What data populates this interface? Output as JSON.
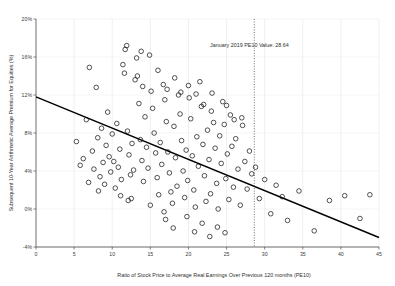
{
  "chart_data": {
    "type": "scatter",
    "title": "",
    "xlabel": "Ratio of Stock Price to Average Real Earnings Over Previous 120 months (PE10)",
    "ylabel": "Subsequent 10-Year Arithmetic Average Premium for Equities (%)",
    "xlim": [
      0,
      45
    ],
    "ylim": [
      -4,
      20
    ],
    "xticks": [
      0,
      5,
      10,
      15,
      20,
      25,
      30,
      35,
      40,
      45
    ],
    "xtick_labels": [
      "0",
      "5",
      "10",
      "15",
      "20",
      "25",
      "30",
      "35",
      "40",
      "45"
    ],
    "yticks": [
      -4,
      0,
      4,
      8,
      12,
      16,
      20
    ],
    "ytick_labels": [
      "-4%",
      "0%",
      "4%",
      "8%",
      "12%",
      "16%",
      "20%"
    ],
    "grid": true,
    "legend": "none",
    "marker": "open-circle",
    "marker_color": "#1a1a1a",
    "line_color": "#000000",
    "annotations": [
      {
        "name": "january-2019-pe10-marker",
        "text": "January 2019 PE10 Value: 28.64",
        "x": 28.64,
        "style": "vertical-dotted-line",
        "label_x": 28.0,
        "label_y": 17.1
      }
    ],
    "trendline": {
      "name": "linear-fit",
      "x_start": 0,
      "y_start": 11.8,
      "x_end": 45,
      "y_end": -3.0
    },
    "points": [
      [
        5.3,
        7.1
      ],
      [
        5.8,
        4.6
      ],
      [
        6.2,
        5.3
      ],
      [
        6.6,
        9.4
      ],
      [
        7.0,
        14.9
      ],
      [
        7.4,
        6.1
      ],
      [
        7.6,
        4.2
      ],
      [
        7.9,
        12.8
      ],
      [
        8.1,
        7.5
      ],
      [
        8.4,
        3.4
      ],
      [
        8.6,
        8.5
      ],
      [
        8.8,
        4.9
      ],
      [
        9.0,
        2.6
      ],
      [
        9.2,
        6.7
      ],
      [
        9.4,
        10.2
      ],
      [
        9.6,
        5.5
      ],
      [
        9.8,
        3.9
      ],
      [
        10.0,
        7.9
      ],
      [
        10.2,
        5.0
      ],
      [
        10.4,
        2.2
      ],
      [
        10.6,
        9.0
      ],
      [
        10.8,
        4.4
      ],
      [
        11.0,
        6.3
      ],
      [
        11.2,
        3.1
      ],
      [
        11.4,
        15.2
      ],
      [
        11.6,
        14.3
      ],
      [
        11.7,
        16.8
      ],
      [
        11.9,
        17.2
      ],
      [
        12.0,
        8.2
      ],
      [
        12.2,
        5.7
      ],
      [
        12.4,
        3.6
      ],
      [
        12.6,
        6.9
      ],
      [
        12.8,
        4.1
      ],
      [
        13.0,
        13.6
      ],
      [
        13.2,
        15.9
      ],
      [
        13.3,
        14.0
      ],
      [
        13.5,
        11.1
      ],
      [
        13.7,
        7.3
      ],
      [
        13.9,
        5.1
      ],
      [
        14.1,
        2.9
      ],
      [
        14.3,
        9.7
      ],
      [
        14.5,
        6.5
      ],
      [
        14.7,
        4.3
      ],
      [
        14.9,
        16.2
      ],
      [
        15.1,
        12.4
      ],
      [
        15.3,
        10.6
      ],
      [
        15.5,
        8.0
      ],
      [
        15.7,
        5.9
      ],
      [
        15.9,
        3.3
      ],
      [
        16.1,
        1.5
      ],
      [
        16.3,
        7.0
      ],
      [
        16.5,
        4.7
      ],
      [
        16.7,
        13.1
      ],
      [
        16.9,
        11.5
      ],
      [
        17.1,
        9.2
      ],
      [
        17.3,
        6.0
      ],
      [
        17.5,
        3.8
      ],
      [
        17.7,
        1.8
      ],
      [
        17.9,
        0.6
      ],
      [
        18.1,
        8.7
      ],
      [
        18.3,
        5.4
      ],
      [
        18.5,
        2.4
      ],
      [
        18.7,
        12.0
      ],
      [
        18.9,
        10.0
      ],
      [
        19.1,
        7.2
      ],
      [
        19.3,
        4.0
      ],
      [
        19.5,
        1.2
      ],
      [
        19.7,
        6.2
      ],
      [
        19.9,
        3.0
      ],
      [
        20.1,
        11.7
      ],
      [
        20.3,
        9.5
      ],
      [
        20.5,
        5.6
      ],
      [
        20.7,
        2.0
      ],
      [
        20.9,
        0.2
      ],
      [
        21.1,
        7.6
      ],
      [
        21.3,
        4.5
      ],
      [
        21.5,
        13.4
      ],
      [
        21.7,
        10.8
      ],
      [
        21.9,
        6.8
      ],
      [
        22.1,
        3.5
      ],
      [
        22.3,
        0.8
      ],
      [
        22.5,
        8.3
      ],
      [
        22.7,
        5.2
      ],
      [
        22.9,
        1.6
      ],
      [
        23.1,
        12.2
      ],
      [
        23.3,
        9.1
      ],
      [
        23.5,
        6.4
      ],
      [
        23.7,
        2.7
      ],
      [
        23.9,
        0.0
      ],
      [
        24.1,
        7.7
      ],
      [
        24.3,
        4.8
      ],
      [
        24.5,
        11.3
      ],
      [
        24.7,
        8.9
      ],
      [
        24.9,
        3.2
      ],
      [
        25.1,
        5.8
      ],
      [
        25.3,
        1.0
      ],
      [
        25.5,
        9.9
      ],
      [
        25.7,
        6.6
      ],
      [
        25.9,
        2.3
      ],
      [
        26.2,
        7.4
      ],
      [
        26.5,
        4.2
      ],
      [
        26.8,
        0.4
      ],
      [
        27.1,
        8.8
      ],
      [
        27.4,
        5.0
      ],
      [
        27.7,
        2.1
      ],
      [
        28.0,
        6.1
      ],
      [
        28.3,
        3.7
      ],
      [
        28.8,
        4.4
      ],
      [
        29.3,
        1.1
      ],
      [
        30.0,
        3.1
      ],
      [
        30.8,
        -0.5
      ],
      [
        31.5,
        2.5
      ],
      [
        32.3,
        1.3
      ],
      [
        33.0,
        -1.2
      ],
      [
        34.5,
        1.9
      ],
      [
        36.5,
        -2.3
      ],
      [
        38.5,
        0.9
      ],
      [
        40.5,
        1.4
      ],
      [
        42.5,
        -1.0
      ],
      [
        43.8,
        1.5
      ],
      [
        6.9,
        2.8
      ],
      [
        8.2,
        1.9
      ],
      [
        12.1,
        0.9
      ],
      [
        13.8,
        16.6
      ],
      [
        14.0,
        12.9
      ],
      [
        16.0,
        14.6
      ],
      [
        17.2,
        12.6
      ],
      [
        18.2,
        13.8
      ],
      [
        19.0,
        12.3
      ],
      [
        20.0,
        13.0
      ],
      [
        21.0,
        12.1
      ],
      [
        22.0,
        11.0
      ],
      [
        23.0,
        10.3
      ],
      [
        25.0,
        10.9
      ],
      [
        26.0,
        9.4
      ],
      [
        27.0,
        9.6
      ],
      [
        11.1,
        1.4
      ],
      [
        12.5,
        1.1
      ],
      [
        15.0,
        0.4
      ],
      [
        16.8,
        -0.3
      ],
      [
        19.8,
        -0.8
      ],
      [
        21.8,
        -1.5
      ],
      [
        23.8,
        -1.9
      ],
      [
        24.8,
        -2.5
      ],
      [
        17.0,
        -1.1
      ],
      [
        18.0,
        -2.0
      ],
      [
        20.8,
        -2.4
      ],
      [
        22.8,
        -2.9
      ]
    ]
  }
}
